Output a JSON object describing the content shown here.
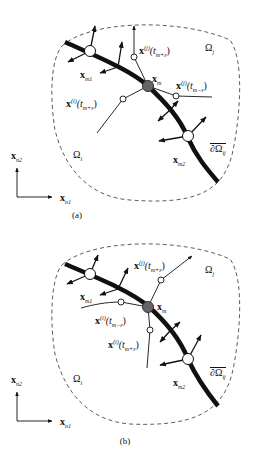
{
  "figure": {
    "panels": [
      {
        "id": "a",
        "caption": "(a)",
        "labels": {
          "x_m1": "x",
          "x_m1_sub": "m1",
          "x_m": "x",
          "x_m_sub": "m",
          "x_m2": "x",
          "x_m2_sub": "m2",
          "traj_top": "x",
          "traj_top_sup": "(j)",
          "traj_top_arg": "(t",
          "traj_top_argsub": "m+ε",
          "traj_top_close": ")",
          "traj_right": "x",
          "traj_right_sup": "(j)",
          "traj_right_arg": "(t",
          "traj_right_argsub": "m−ε",
          "traj_right_close": ")",
          "traj_left": "x",
          "traj_left_sup": "(i)",
          "traj_left_arg": "(t",
          "traj_left_argsub": "m+ε",
          "traj_left_close": ")",
          "omega_j": "Ω",
          "omega_j_sub": "j",
          "omega_i": "Ω",
          "omega_i_sub": "i",
          "boundary": "∂Ω",
          "boundary_sub": "ij",
          "axis_y": "x",
          "axis_y_sub": "n2",
          "axis_x": "x",
          "axis_x_sub": "n1"
        }
      },
      {
        "id": "b",
        "caption": "(b)",
        "labels": {
          "x_m1": "x",
          "x_m1_sub": "m1",
          "x_m": "x",
          "x_m_sub": "m",
          "x_m2": "x",
          "x_m2_sub": "m2",
          "traj_top": "x",
          "traj_top_sup": "(j)",
          "traj_top_arg": "(t",
          "traj_top_argsub": "m+ε",
          "traj_top_close": ")",
          "traj_mid": "x",
          "traj_mid_sup": "(i)",
          "traj_mid_arg": "(t",
          "traj_mid_argsub": "m−ε",
          "traj_mid_close": ")",
          "traj_low": "x",
          "traj_low_sup": "(i)",
          "traj_low_arg": "(t",
          "traj_low_argsub": "m+ε",
          "traj_low_close": ")",
          "omega_j": "Ω",
          "omega_j_sub": "j",
          "omega_i": "Ω",
          "omega_i_sub": "i",
          "boundary": "∂Ω",
          "boundary_sub": "ij",
          "axis_y": "x",
          "axis_y_sub": "n2",
          "axis_x": "x",
          "axis_x_sub": "n1"
        }
      }
    ],
    "colors": {
      "stroke": "#111111",
      "node_fill": "#ffffff",
      "center_node_fill": "#666666",
      "dashed_boundary": "#333333"
    }
  }
}
